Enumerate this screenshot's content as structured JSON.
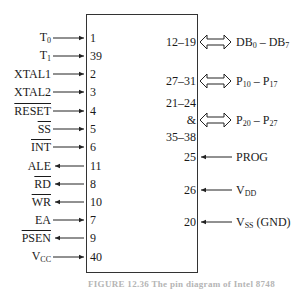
{
  "chip": {
    "left_pins": [
      {
        "signal": "T0",
        "base": "T",
        "sub": "0",
        "pin": "1",
        "dir": "in",
        "overbar": false
      },
      {
        "signal": "T1",
        "base": "T",
        "sub": "1",
        "pin": "39",
        "dir": "in",
        "overbar": false
      },
      {
        "signal": "XTAL1",
        "base": "XTAL1",
        "sub": "",
        "pin": "2",
        "dir": "in",
        "overbar": false
      },
      {
        "signal": "XTAL2",
        "base": "XTAL2",
        "sub": "",
        "pin": "3",
        "dir": "in",
        "overbar": false
      },
      {
        "signal": "RESET",
        "base": "RESET",
        "sub": "",
        "pin": "4",
        "dir": "in",
        "overbar": true
      },
      {
        "signal": "SS",
        "base": "SS",
        "sub": "",
        "pin": "5",
        "dir": "in",
        "overbar": true
      },
      {
        "signal": "INT",
        "base": "INT",
        "sub": "",
        "pin": "6",
        "dir": "in",
        "overbar": true
      },
      {
        "signal": "ALE",
        "base": "ALE",
        "sub": "",
        "pin": "11",
        "dir": "out",
        "overbar": false
      },
      {
        "signal": "RD",
        "base": "RD",
        "sub": "",
        "pin": "8",
        "dir": "out",
        "overbar": true
      },
      {
        "signal": "WR",
        "base": "WR",
        "sub": "",
        "pin": "10",
        "dir": "out",
        "overbar": true
      },
      {
        "signal": "EA",
        "base": "EA",
        "sub": "",
        "pin": "7",
        "dir": "in",
        "overbar": false
      },
      {
        "signal": "PSEN",
        "base": "PSEN",
        "sub": "",
        "pin": "9",
        "dir": "out",
        "overbar": true
      },
      {
        "signal": "VCC",
        "base": "V",
        "sub": "CC",
        "pin": "40",
        "dir": "in",
        "overbar": false
      }
    ],
    "right_pins": [
      {
        "pin": "12–19",
        "signal": "DB0 – DB7",
        "a": "DB",
        "a_sub": "0",
        "sep": " – ",
        "b": "DB",
        "b_sub": "7",
        "dir": "bidir"
      },
      {
        "pin": "27–31",
        "signal": "P10 – P17",
        "a": "P",
        "a_sub": "10",
        "sep": " – ",
        "b": "P",
        "b_sub": "17",
        "dir": "bidir"
      },
      {
        "pin_line1": "21–24",
        "pin_line2": "&",
        "pin_line3": "35–38",
        "signal": "P20 – P27",
        "a": "P",
        "a_sub": "20",
        "sep": " – ",
        "b": "P",
        "b_sub": "27",
        "dir": "bidir"
      },
      {
        "pin": "25",
        "signal": "PROG",
        "a": "PROG",
        "dir": "in"
      },
      {
        "pin": "26",
        "signal": "VDD",
        "a": "V",
        "a_sub": "DD",
        "dir": "in"
      },
      {
        "pin": "20",
        "signal": "VSS (GND)",
        "a": "V",
        "a_sub": "SS",
        "suffix": " (GND)",
        "dir": "in"
      }
    ]
  },
  "caption": "FIGURE 12.36   The pin diagram of Intel 8748"
}
